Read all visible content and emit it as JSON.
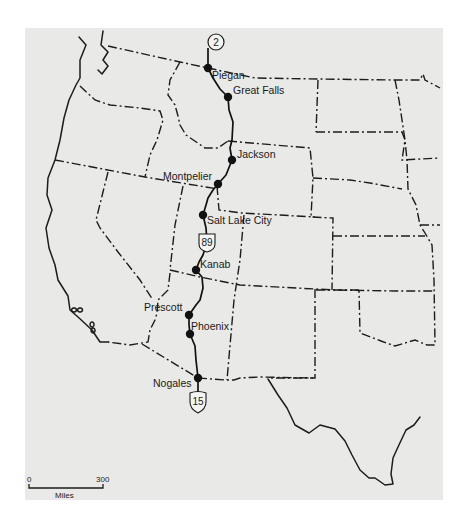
{
  "map": {
    "type": "route-map",
    "region": "Western United States",
    "colors": {
      "background": "#e9e9e7",
      "ink": "#1c1c1c"
    },
    "route_shields": [
      {
        "label": "2",
        "shape": "circle",
        "x": 216,
        "y": 42
      },
      {
        "label": "89",
        "shape": "us-shield",
        "x": 207,
        "y": 242
      },
      {
        "label": "15",
        "shape": "interstate-shield",
        "x": 198,
        "y": 402
      }
    ],
    "cities": [
      {
        "name": "Piegan",
        "x": 208,
        "y": 68,
        "label_x": 212,
        "label_y": 78
      },
      {
        "name": "Great Falls",
        "x": 228,
        "y": 97,
        "label_x": 233,
        "label_y": 94
      },
      {
        "name": "Jackson",
        "x": 232,
        "y": 160,
        "label_x": 237,
        "label_y": 158
      },
      {
        "name": "Montpelier",
        "x": 218,
        "y": 184,
        "label_x": 163,
        "label_y": 180
      },
      {
        "name": "Salt Lake City",
        "x": 203,
        "y": 215,
        "label_x": 207,
        "label_y": 224
      },
      {
        "name": "Kanab",
        "x": 196,
        "y": 270,
        "label_x": 200,
        "label_y": 268
      },
      {
        "name": "Prescott",
        "x": 189,
        "y": 315,
        "label_x": 144,
        "label_y": 311
      },
      {
        "name": "Phoenix",
        "x": 190,
        "y": 334,
        "label_x": 191,
        "label_y": 330
      },
      {
        "name": "Nogales",
        "x": 198,
        "y": 378,
        "label_x": 153,
        "label_y": 387
      }
    ],
    "scale_bar": {
      "start_label": "0",
      "end_label": "300",
      "unit_label": "Miles"
    }
  },
  "geometry": {
    "coast": [
      "M103,31 L101,45 L108,52 L103,60 L108,66 L102,74 L98,70 M79,37 L86,45 L80,60 L80,78 L76,85 L69,100 L64,118 L60,140 L55,160 L48,178 L47,195 L52,210 L46,228 L49,248 L55,265 L58,280 L68,296 L70,310 L78,317 L92,330 L100,342 L108,342",
      "M74,308 a2.5,2 0 1 0 0.1,0 M80,308 a2.5,2 0 1 0 0.1,0 M92,322 a2,2.5 0 1 0 0.1,0 M93,328 a2,2.5 0 1 0 0.1,0",
      "M420,417 L414,425 L406,430 L398,447 L393,458 L391,474 L393,484 L385,485 L375,478 L369,478 L360,470 L352,455 L345,441 L335,429 L320,425 L309,433 L295,425 L287,408 L278,395 L268,379"
    ],
    "borders": [
      "M108,46 L180,62 L208,68 L255,78 L318,79 L395,80 L420,80 L423,74 L425,80 L440,88",
      "M80,86 L95,100 L110,105 L140,108 L160,111 L163,120 L157,140 L150,155 L145,177",
      "M55,160 L145,177 L218,189",
      "M108,172 L96,220 L100,228 L118,252 L140,280 L153,300",
      "M183,186 L175,225 L170,270",
      "M170,270 L200,277 L240,285 L315,289 L335,290 L395,291 L433,291",
      "M170,273 L168,290 L162,296 L158,300 L157,313 L155,320 L150,330 L148,342 L130,345 L108,342",
      "M142,344 L198,378",
      "M198,378 L225,380 L234,380 L240,378 L260,377 L313,378",
      "M244,215 L240,260 L234,300 L227,380",
      "M180,62 L170,80 L168,95 L175,105 L178,116 L180,125 L186,135 L205,148 L218,148 L228,141",
      "M228,141 L310,148 L313,178 L311,217 L333,218 L332,290",
      "M217,186 L219,210 L242,213 L315,217",
      "M313,178 L350,180 L370,183 L402,189",
      "M316,132 L402,132 L405,140 L402,160 L440,158",
      "M318,80 L316,132",
      "M395,80 L399,100 L405,140 L407,160 L408,189 L416,205 L420,225 L425,233 L432,245 L434,280 L435,345 L427,345 L415,340 L395,346 L381,341 L360,333 L359,290",
      "M420,225 L440,225",
      "M333,236 L425,236",
      "M315,289 L315,378 L268,378",
      "M359,290 L313,290"
    ],
    "route": "M208,48 L208,68 L213,78 L220,89 L228,97 L229,110 L233,122 L232,140 L230,148 L232,160 L226,175 L218,184 L213,190 L208,198 L206,205 L203,215 L206,228 L207,242 L203,255 L199,262 L196,270 L202,277 L203,288 L200,300 L196,305 L189,315 L189,325 L190,334 L195,346 L196,360 L198,378 L198,396"
  }
}
